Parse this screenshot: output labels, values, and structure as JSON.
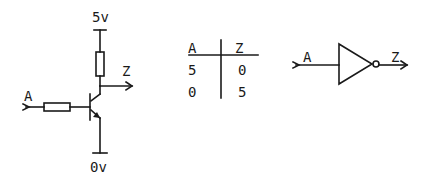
{
  "circuit": {
    "supply_label": "5v",
    "ground_label": "0v",
    "input_label": "A",
    "output_label": "Z"
  },
  "truth_table": {
    "headers": [
      "A",
      "Z"
    ],
    "rows": [
      [
        "5",
        "0"
      ],
      [
        "0",
        "5"
      ]
    ]
  },
  "gate_symbol": {
    "input_label": "A",
    "output_label": "Z",
    "type": "NOT"
  }
}
